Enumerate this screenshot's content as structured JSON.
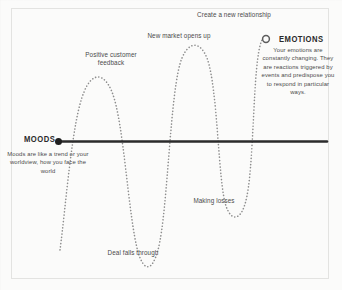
{
  "diagram": {
    "moods": {
      "title": "MOODS",
      "description": "Moods are like a trend or your worldview, how you face the world",
      "marker": "filled-dot",
      "line_color": "#2b2b2b"
    },
    "emotions": {
      "title": "EMOTIONS",
      "description": "Your emotions are constantly changing. They are reactions triggered by events and predispose you to respond in particular ways.",
      "marker": "hollow-circle",
      "wave_color": "#8d8d8d"
    },
    "event_labels": [
      {
        "id": "positive-customer-feedback",
        "text": "Positive customer feedback",
        "position": "peak"
      },
      {
        "id": "new-market-opens-up",
        "text": "New market opens up",
        "position": "peak"
      },
      {
        "id": "create-a-new-relationship",
        "text": "Create a new relationship",
        "position": "peak"
      },
      {
        "id": "making-losses",
        "text": "Making losses",
        "position": "trough"
      },
      {
        "id": "deal-falls-through",
        "text": "Deal falls through",
        "position": "trough"
      }
    ]
  }
}
